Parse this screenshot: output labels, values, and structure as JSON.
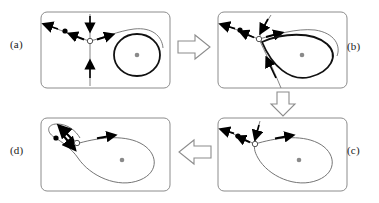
{
  "figure": {
    "background_color": "#ffffff",
    "panel_border_color": "#8c8c8c",
    "thin_curve_color": "#6e6e6e",
    "thick_curve_color": "#111111",
    "arrowhead_color": "#000000",
    "node_color": "#000000",
    "saddle_fill_color": "#ffffff",
    "saddle_stroke_color": "#555555",
    "focus_color": "#8a8a8a",
    "block_arrow_stroke": "#8c8c8c",
    "block_arrow_fill": "#ffffff"
  },
  "panels": [
    {
      "id": "a",
      "label": "(a)",
      "position": "top-left",
      "caption_text": "(a)",
      "features": [
        "stable node (black dot) on left branch",
        "saddle point (open circle) at center",
        "vertical stable manifold through saddle",
        "large thick limit cycle on right",
        "unstable focus (gray dot) inside limit cycle"
      ],
      "limit_cycle_shape": "circle",
      "limit_cycle_weight": "thick"
    },
    {
      "id": "b",
      "label": "(b)",
      "position": "top-right",
      "caption_text": "(b)",
      "features": [
        "stable node (black dot) on left branch",
        "saddle point (open circle)",
        "thick limit cycle deformed into teardrop approaching saddle",
        "unstable focus (gray dot) inside teardrop"
      ],
      "limit_cycle_shape": "teardrop",
      "limit_cycle_weight": "thick"
    },
    {
      "id": "c",
      "label": "(c)",
      "position": "bottom-right",
      "caption_text": "(c)",
      "features": [
        "stable node (black dot) on left branch",
        "saddle point (open circle)",
        "homoclinic loop attached to saddle",
        "unstable focus (gray dot) inside loop"
      ],
      "limit_cycle_shape": "homoclinic-loop",
      "limit_cycle_weight": "thin"
    },
    {
      "id": "d",
      "label": "(d)",
      "position": "bottom-left",
      "caption_text": "(d)",
      "features": [
        "broken loop: large right loop and small left loop",
        "stable node (black dot) inside small left loop",
        "saddle point (open circle)",
        "unstable focus (gray dot) inside large loop"
      ],
      "limit_cycle_shape": "broken-loop",
      "limit_cycle_weight": "thin"
    }
  ],
  "flow_arrows": [
    {
      "name": "arrow-a-to-b",
      "direction": "right",
      "from_panel": "a",
      "to_panel": "b"
    },
    {
      "name": "arrow-b-to-c",
      "direction": "down",
      "from_panel": "b",
      "to_panel": "c"
    },
    {
      "name": "arrow-c-to-d",
      "direction": "left",
      "from_panel": "c",
      "to_panel": "d"
    }
  ]
}
